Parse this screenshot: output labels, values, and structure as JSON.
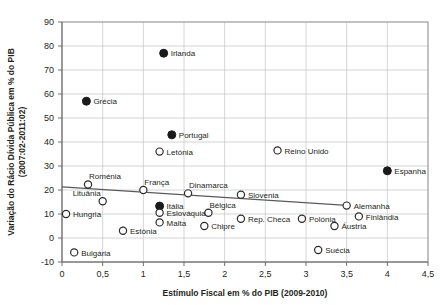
{
  "chart_data": {
    "type": "scatter",
    "title": "",
    "xlabel": "Estímulo Fiscal em % do PIB (2009-2010)",
    "ylabel": "Variação do Rácio Dívida Pública em % do PIB (2007:02-2011:02)",
    "ylabel_line1": "Variação do Rácio Dívida Pública em % do PIB",
    "ylabel_line2": "(2007:02-2011:02)",
    "xlim": [
      0,
      4.5
    ],
    "ylim": [
      -10,
      90
    ],
    "xticks": [
      0,
      0.5,
      1,
      1.5,
      2,
      2.5,
      3,
      3.5,
      4,
      4.5
    ],
    "xticklabels": [
      "0",
      "0,5",
      "1",
      "1,5",
      "2",
      "2,5",
      "3",
      "3,5",
      "4",
      "4,5"
    ],
    "yticks": [
      -10,
      0,
      10,
      20,
      30,
      40,
      50,
      60,
      70,
      80,
      90
    ],
    "yticklabels": [
      "-10",
      "0",
      "10",
      "20",
      "30",
      "40",
      "50",
      "60",
      "70",
      "80",
      "90"
    ],
    "grid": true,
    "legend": "none",
    "marker_styles": {
      "filled": "#1a1a1a",
      "hollow": "#ffffff",
      "hollow_edge": "#2b2b2b"
    },
    "trendline": {
      "present": true,
      "x0": 0.0,
      "y0": 21.3,
      "x1": 3.5,
      "y1": 13.6,
      "color": "#5a5a5a"
    },
    "points": [
      {
        "label": "Irlanda",
        "x": 1.25,
        "y": 77.0,
        "style": "filled",
        "label_pos": "right"
      },
      {
        "label": "Grécia",
        "x": 0.3,
        "y": 57.0,
        "style": "filled",
        "label_pos": "right"
      },
      {
        "label": "Portugal",
        "x": 1.35,
        "y": 43.0,
        "style": "filled",
        "label_pos": "right"
      },
      {
        "label": "Letónia",
        "x": 1.2,
        "y": 36.0,
        "style": "hollow",
        "label_pos": "right"
      },
      {
        "label": "Reino Unido",
        "x": 2.65,
        "y": 36.5,
        "style": "hollow",
        "label_pos": "right"
      },
      {
        "label": "Espanha",
        "x": 4.0,
        "y": 28.0,
        "style": "filled",
        "label_pos": "right"
      },
      {
        "label": "Roménia",
        "x": 0.32,
        "y": 22.3,
        "style": "hollow",
        "label_pos": "above-right"
      },
      {
        "label": "França",
        "x": 1.0,
        "y": 20.0,
        "style": "hollow",
        "label_pos": "above-right"
      },
      {
        "label": "Dinamarca",
        "x": 1.55,
        "y": 18.6,
        "style": "hollow",
        "label_pos": "above-right"
      },
      {
        "label": "Slovenia",
        "x": 2.2,
        "y": 18.0,
        "style": "hollow",
        "label_pos": "right"
      },
      {
        "label": "Lituânia",
        "x": 0.5,
        "y": 15.3,
        "style": "hollow",
        "label_pos": "above-left"
      },
      {
        "label": "Alemanha",
        "x": 3.5,
        "y": 13.5,
        "style": "hollow",
        "label_pos": "right"
      },
      {
        "label": "Itália",
        "x": 1.2,
        "y": 13.3,
        "style": "filled",
        "label_pos": "right"
      },
      {
        "label": "Bélgica",
        "x": 1.8,
        "y": 10.5,
        "style": "hollow",
        "label_pos": "above-right"
      },
      {
        "label": "Eslováquia",
        "x": 1.2,
        "y": 10.5,
        "style": "hollow",
        "label_pos": "right"
      },
      {
        "label": "Hungria",
        "x": 0.05,
        "y": 10.0,
        "style": "hollow",
        "label_pos": "right"
      },
      {
        "label": "Finlândia",
        "x": 3.65,
        "y": 9.0,
        "style": "hollow",
        "label_pos": "right"
      },
      {
        "label": "Rep. Checa",
        "x": 2.2,
        "y": 8.0,
        "style": "hollow",
        "label_pos": "right"
      },
      {
        "label": "Polónia",
        "x": 2.95,
        "y": 8.0,
        "style": "hollow",
        "label_pos": "right"
      },
      {
        "label": "Malta",
        "x": 1.2,
        "y": 6.5,
        "style": "hollow",
        "label_pos": "right"
      },
      {
        "label": "Chipre",
        "x": 1.75,
        "y": 5.0,
        "style": "hollow",
        "label_pos": "right"
      },
      {
        "label": "Áustria",
        "x": 3.35,
        "y": 5.0,
        "style": "hollow",
        "label_pos": "right"
      },
      {
        "label": "Estónia",
        "x": 0.75,
        "y": 3.0,
        "style": "hollow",
        "label_pos": "right"
      },
      {
        "label": "Suécia",
        "x": 3.15,
        "y": -5.0,
        "style": "hollow",
        "label_pos": "right"
      },
      {
        "label": "Bulgária",
        "x": 0.15,
        "y": -6.0,
        "style": "hollow",
        "label_pos": "right"
      }
    ]
  }
}
